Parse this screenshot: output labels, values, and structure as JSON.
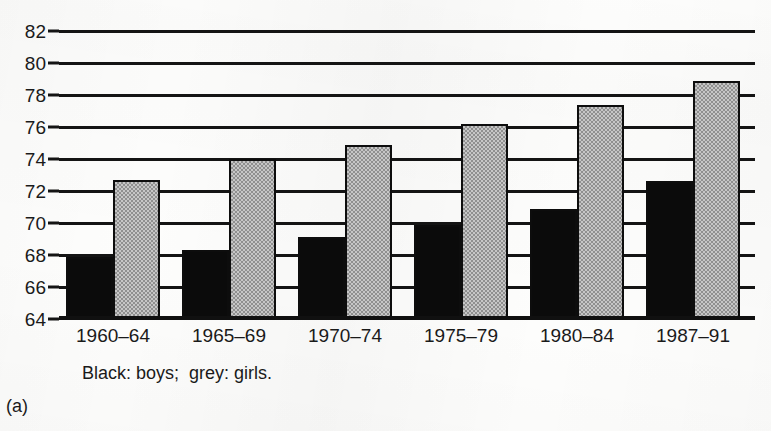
{
  "chart_data": {
    "type": "bar",
    "title": "",
    "subtitle": "",
    "xlabel": "",
    "ylabel": "",
    "categories": [
      "1960–64",
      "1965–69",
      "1970–74",
      "1975–79",
      "1980–84",
      "1987–91"
    ],
    "series": [
      {
        "name": "Black: boys",
        "color": "#0b0b0b",
        "values": [
          67.9,
          68.3,
          69.1,
          69.9,
          70.9,
          72.6
        ]
      },
      {
        "name": "grey: girls",
        "color": "#a8a8a8",
        "values": [
          72.7,
          74.0,
          74.9,
          76.2,
          77.4,
          78.9
        ]
      }
    ],
    "ylim": [
      64,
      82
    ],
    "ytick_labels": [
      "82",
      "80",
      "78",
      "76",
      "74",
      "72",
      "70",
      "68",
      "66",
      "64"
    ],
    "ytick_values": [
      82,
      80,
      78,
      76,
      74,
      72,
      70,
      68,
      66,
      64
    ],
    "grid": true,
    "grid_axis": "y",
    "legend": "Black: boys;  grey: girls.",
    "legend_position": "below-axis",
    "panel_label": "(a)"
  },
  "annotations": {
    "legend_note": "Black: boys;  grey: girls.",
    "panel_label": "(a)"
  }
}
